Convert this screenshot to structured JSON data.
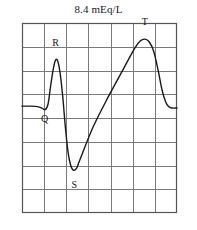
{
  "figure": {
    "title": "8.4 mEq/L",
    "background_color": "#ffffff"
  },
  "chart_data": {
    "type": "line",
    "title": "8.4 mEq/L",
    "subtitle": "",
    "xlabel": "",
    "ylabel": "",
    "grid": {
      "visible": true,
      "columns": 7,
      "rows": 8,
      "line_color": "#7a7a7a",
      "border_color": "#555555"
    },
    "legend": {
      "visible": false,
      "position": "none"
    },
    "xlim": [
      0,
      7
    ],
    "ylim": [
      0,
      8
    ],
    "series": [
      {
        "name": "ECG tracing",
        "color": "#1a1a1a",
        "line_width": 1.4,
        "points": [
          [
            0.0,
            4.5
          ],
          [
            0.4,
            4.5
          ],
          [
            0.7,
            4.48
          ],
          [
            0.9,
            4.42
          ],
          [
            1.05,
            4.35
          ],
          [
            1.18,
            4.6
          ],
          [
            1.3,
            5.4
          ],
          [
            1.42,
            6.1
          ],
          [
            1.52,
            6.45
          ],
          [
            1.62,
            6.38
          ],
          [
            1.72,
            5.9
          ],
          [
            1.84,
            4.9
          ],
          [
            1.96,
            3.6
          ],
          [
            2.08,
            2.55
          ],
          [
            2.2,
            2.0
          ],
          [
            2.32,
            1.8
          ],
          [
            2.46,
            1.88
          ],
          [
            2.62,
            2.25
          ],
          [
            3.2,
            3.6
          ],
          [
            3.9,
            4.9
          ],
          [
            4.6,
            6.1
          ],
          [
            5.1,
            6.95
          ],
          [
            5.35,
            7.25
          ],
          [
            5.55,
            7.32
          ],
          [
            5.75,
            7.2
          ],
          [
            5.95,
            6.8
          ],
          [
            6.15,
            6.0
          ],
          [
            6.32,
            5.2
          ],
          [
            6.48,
            4.7
          ],
          [
            6.62,
            4.48
          ],
          [
            6.78,
            4.42
          ],
          [
            7.0,
            4.42
          ]
        ]
      }
    ],
    "annotations": [
      {
        "label": "Q",
        "x": 1.02,
        "y": 3.85,
        "point_x": 1.05,
        "point_y": 4.35
      },
      {
        "label": "R",
        "x": 1.52,
        "y": 7.05,
        "point_x": 1.52,
        "point_y": 6.45
      },
      {
        "label": "S",
        "x": 2.36,
        "y": 1.05,
        "point_x": 2.34,
        "point_y": 1.8
      },
      {
        "label": "T",
        "x": 5.55,
        "y": 7.9,
        "point_x": 5.55,
        "point_y": 7.32
      }
    ]
  }
}
